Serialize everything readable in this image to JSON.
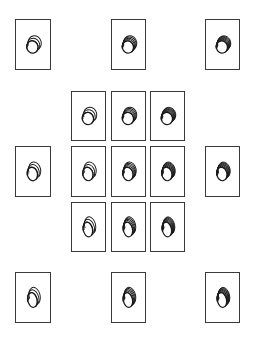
{
  "figure": {
    "stroke_color": "#1a1a1a",
    "border_color": "#3a3a3a",
    "cards": [
      {
        "id": "ref-top-left",
        "x": 15,
        "y": 19,
        "w": 36,
        "h": 51,
        "arcs": 3,
        "elong": 1.1
      },
      {
        "id": "ref-top-center",
        "x": 111,
        "y": 19,
        "w": 35,
        "h": 51,
        "arcs": 5,
        "elong": 1.1
      },
      {
        "id": "ref-top-right",
        "x": 205,
        "y": 19,
        "w": 35,
        "h": 51,
        "arcs": 8,
        "elong": 1.1
      },
      {
        "id": "grid-r1-c1",
        "x": 71,
        "y": 91,
        "w": 35,
        "h": 50,
        "arcs": 3,
        "elong": 1.1
      },
      {
        "id": "grid-r1-c2",
        "x": 111,
        "y": 91,
        "w": 35,
        "h": 50,
        "arcs": 5,
        "elong": 1.1
      },
      {
        "id": "grid-r1-c3",
        "x": 150,
        "y": 91,
        "w": 35,
        "h": 50,
        "arcs": 8,
        "elong": 1.1
      },
      {
        "id": "ref-mid-left",
        "x": 15,
        "y": 146,
        "w": 36,
        "h": 51,
        "arcs": 3,
        "elong": 1.35
      },
      {
        "id": "grid-r2-c1",
        "x": 71,
        "y": 146,
        "w": 35,
        "h": 51,
        "arcs": 3,
        "elong": 1.35
      },
      {
        "id": "grid-r2-c2",
        "x": 111,
        "y": 146,
        "w": 35,
        "h": 51,
        "arcs": 5,
        "elong": 1.35
      },
      {
        "id": "grid-r2-c3",
        "x": 150,
        "y": 146,
        "w": 35,
        "h": 51,
        "arcs": 8,
        "elong": 1.35
      },
      {
        "id": "ref-mid-right",
        "x": 205,
        "y": 146,
        "w": 35,
        "h": 51,
        "arcs": 8,
        "elong": 1.35
      },
      {
        "id": "grid-r3-c1",
        "x": 71,
        "y": 202,
        "w": 35,
        "h": 50,
        "arcs": 3,
        "elong": 1.6
      },
      {
        "id": "grid-r3-c2",
        "x": 111,
        "y": 202,
        "w": 35,
        "h": 50,
        "arcs": 5,
        "elong": 1.6
      },
      {
        "id": "grid-r3-c3",
        "x": 150,
        "y": 202,
        "w": 35,
        "h": 50,
        "arcs": 8,
        "elong": 1.6
      },
      {
        "id": "ref-bottom-left",
        "x": 15,
        "y": 272,
        "w": 36,
        "h": 51,
        "arcs": 3,
        "elong": 1.6
      },
      {
        "id": "ref-bottom-center",
        "x": 111,
        "y": 272,
        "w": 35,
        "h": 51,
        "arcs": 5,
        "elong": 1.6
      },
      {
        "id": "ref-bottom-right",
        "x": 205,
        "y": 272,
        "w": 35,
        "h": 51,
        "arcs": 8,
        "elong": 1.6
      }
    ]
  }
}
